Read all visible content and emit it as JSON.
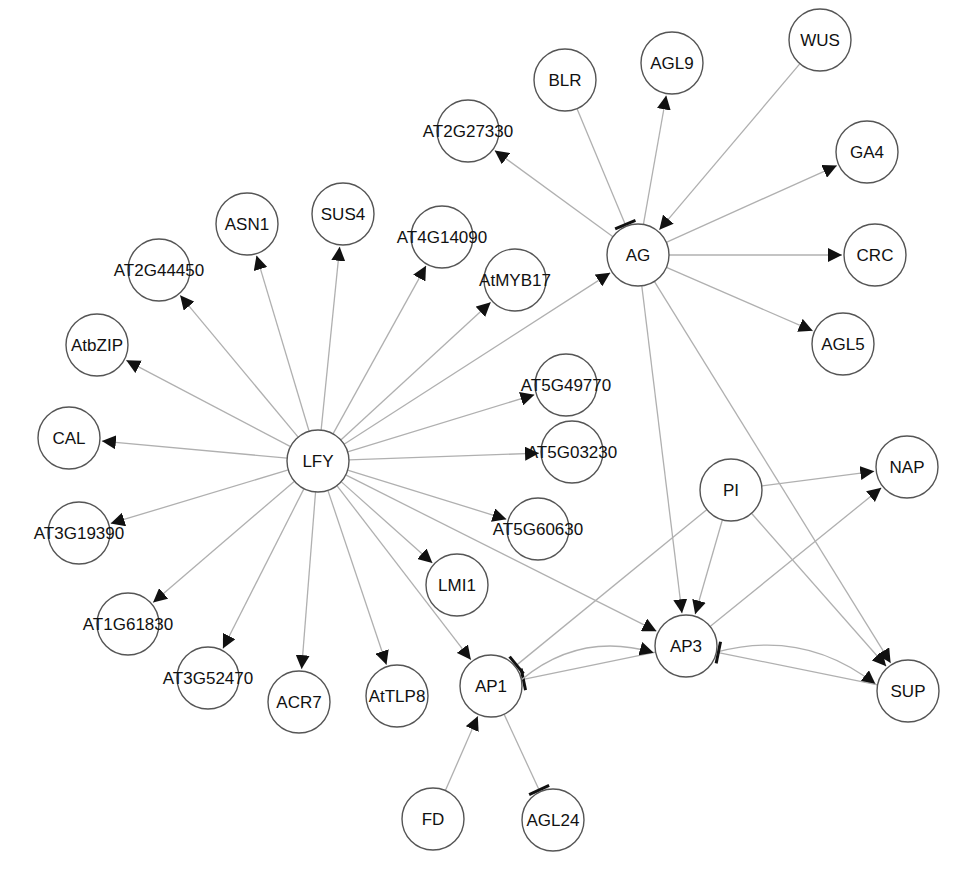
{
  "diagram": {
    "type": "gene regulatory network",
    "node_radius": 31,
    "nodes": [
      {
        "id": "LFY",
        "x": 318,
        "y": 461
      },
      {
        "id": "AG",
        "x": 638,
        "y": 255
      },
      {
        "id": "BLR",
        "x": 565,
        "y": 80
      },
      {
        "id": "AGL9",
        "x": 672,
        "y": 63
      },
      {
        "id": "WUS",
        "x": 820,
        "y": 40
      },
      {
        "id": "GA4",
        "x": 867,
        "y": 152
      },
      {
        "id": "CRC",
        "x": 875,
        "y": 255
      },
      {
        "id": "AGL5",
        "x": 843,
        "y": 344
      },
      {
        "id": "AT2G27330",
        "x": 468,
        "y": 131
      },
      {
        "id": "ASN1",
        "x": 247,
        "y": 224
      },
      {
        "id": "SUS4",
        "x": 343,
        "y": 214
      },
      {
        "id": "AT4G14090",
        "x": 442,
        "y": 237
      },
      {
        "id": "AtMYB17",
        "x": 515,
        "y": 280
      },
      {
        "id": "AT2G44450",
        "x": 159,
        "y": 270
      },
      {
        "id": "AtbZIP",
        "x": 97,
        "y": 345
      },
      {
        "id": "CAL",
        "x": 69,
        "y": 438
      },
      {
        "id": "AT3G19390",
        "x": 79,
        "y": 533
      },
      {
        "id": "AT1G61830",
        "x": 128,
        "y": 624
      },
      {
        "id": "AT3G52470",
        "x": 208,
        "y": 678
      },
      {
        "id": "ACR7",
        "x": 299,
        "y": 702
      },
      {
        "id": "AtTLP8",
        "x": 397,
        "y": 696
      },
      {
        "id": "LMI1",
        "x": 457,
        "y": 585
      },
      {
        "id": "AT5G49770",
        "x": 566,
        "y": 385
      },
      {
        "id": "AT5G03230",
        "x": 572,
        "y": 452
      },
      {
        "id": "AT5G60630",
        "x": 538,
        "y": 529
      },
      {
        "id": "AP1",
        "x": 491,
        "y": 686
      },
      {
        "id": "AP3",
        "x": 686,
        "y": 646
      },
      {
        "id": "PI",
        "x": 731,
        "y": 490
      },
      {
        "id": "NAP",
        "x": 907,
        "y": 467
      },
      {
        "id": "SUP",
        "x": 908,
        "y": 691
      },
      {
        "id": "FD",
        "x": 433,
        "y": 819
      },
      {
        "id": "AGL24",
        "x": 553,
        "y": 820
      }
    ],
    "edges": [
      {
        "from": "LFY",
        "to": "AG",
        "type": "activation"
      },
      {
        "from": "LFY",
        "to": "ASN1",
        "type": "activation"
      },
      {
        "from": "LFY",
        "to": "SUS4",
        "type": "activation"
      },
      {
        "from": "LFY",
        "to": "AT4G14090",
        "type": "activation"
      },
      {
        "from": "LFY",
        "to": "AtMYB17",
        "type": "activation"
      },
      {
        "from": "LFY",
        "to": "AT2G44450",
        "type": "activation"
      },
      {
        "from": "LFY",
        "to": "AtbZIP",
        "type": "activation"
      },
      {
        "from": "LFY",
        "to": "CAL",
        "type": "activation"
      },
      {
        "from": "LFY",
        "to": "AT3G19390",
        "type": "activation"
      },
      {
        "from": "LFY",
        "to": "AT1G61830",
        "type": "activation"
      },
      {
        "from": "LFY",
        "to": "AT3G52470",
        "type": "activation"
      },
      {
        "from": "LFY",
        "to": "ACR7",
        "type": "activation"
      },
      {
        "from": "LFY",
        "to": "AtTLP8",
        "type": "activation"
      },
      {
        "from": "LFY",
        "to": "LMI1",
        "type": "activation"
      },
      {
        "from": "LFY",
        "to": "AP1",
        "type": "activation"
      },
      {
        "from": "LFY",
        "to": "AP3",
        "type": "activation"
      },
      {
        "from": "LFY",
        "to": "AT5G49770",
        "type": "activation"
      },
      {
        "from": "LFY",
        "to": "AT5G03230",
        "type": "activation"
      },
      {
        "from": "LFY",
        "to": "AT5G60630",
        "type": "activation"
      },
      {
        "from": "AG",
        "to": "AT2G27330",
        "type": "activation"
      },
      {
        "from": "BLR",
        "to": "AG",
        "type": "repression"
      },
      {
        "from": "AG",
        "to": "AGL9",
        "type": "activation"
      },
      {
        "from": "WUS",
        "to": "AG",
        "type": "activation"
      },
      {
        "from": "AG",
        "to": "GA4",
        "type": "activation"
      },
      {
        "from": "AG",
        "to": "CRC",
        "type": "activation"
      },
      {
        "from": "AG",
        "to": "AGL5",
        "type": "activation"
      },
      {
        "from": "AG",
        "to": "AP3",
        "type": "activation"
      },
      {
        "from": "AG",
        "to": "SUP",
        "type": "activation"
      },
      {
        "from": "PI",
        "to": "AP3",
        "type": "activation"
      },
      {
        "from": "PI",
        "to": "NAP",
        "type": "activation"
      },
      {
        "from": "PI",
        "to": "SUP",
        "type": "activation"
      },
      {
        "from": "PI",
        "to": "AP1",
        "type": "repression"
      },
      {
        "from": "AP3",
        "to": "NAP",
        "type": "activation"
      },
      {
        "from": "AP3",
        "to": "SUP",
        "type": "activation",
        "curved": true
      },
      {
        "from": "AP3",
        "to": "AP1",
        "type": "repression"
      },
      {
        "from": "AP1",
        "to": "AP3",
        "type": "activation",
        "curved": true
      },
      {
        "from": "SUP",
        "to": "AP3",
        "type": "repression"
      },
      {
        "from": "FD",
        "to": "AP1",
        "type": "activation"
      },
      {
        "from": "AP1",
        "to": "AGL24",
        "type": "repression"
      }
    ]
  }
}
